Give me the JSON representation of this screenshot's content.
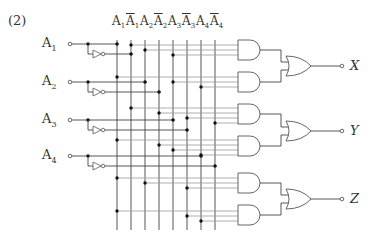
{
  "problem_number": "(2)",
  "inputs": [
    {
      "label": "A",
      "sub": "1",
      "y": 44,
      "inv_y": 54,
      "col": 117,
      "inv_col": 131
    },
    {
      "label": "A",
      "sub": "2",
      "y": 82,
      "inv_y": 92,
      "col": 145,
      "inv_col": 159
    },
    {
      "label": "A",
      "sub": "3",
      "y": 120,
      "inv_y": 130,
      "col": 173,
      "inv_col": 187
    },
    {
      "label": "A",
      "sub": "4",
      "y": 156,
      "inv_y": 166,
      "col": 201,
      "inv_col": 215
    }
  ],
  "bus_columns": [
    {
      "label": "A",
      "sub": "1",
      "inverted": false,
      "x": 117
    },
    {
      "label": "A",
      "sub": "1",
      "inverted": true,
      "x": 131
    },
    {
      "label": "A",
      "sub": "2",
      "inverted": false,
      "x": 145
    },
    {
      "label": "A",
      "sub": "2",
      "inverted": true,
      "x": 159
    },
    {
      "label": "A",
      "sub": "3",
      "inverted": false,
      "x": 173
    },
    {
      "label": "A",
      "sub": "3",
      "inverted": true,
      "x": 187
    },
    {
      "label": "A",
      "sub": "4",
      "inverted": false,
      "x": 201
    },
    {
      "label": "A",
      "sub": "4",
      "inverted": true,
      "x": 215
    }
  ],
  "and_gates": [
    {
      "y": 50,
      "inputs": [
        {
          "y": 45,
          "col": 131
        },
        {
          "y": 50,
          "col": 145
        },
        {
          "y": 55,
          "col": 173
        }
      ]
    },
    {
      "y": 82,
      "inputs": [
        {
          "y": 77,
          "col": 117
        },
        {
          "y": 82,
          "col": 173
        },
        {
          "y": 87,
          "col": 201
        }
      ]
    },
    {
      "y": 114,
      "inputs": [
        {
          "y": 108,
          "col": 131
        },
        {
          "y": 113,
          "col": 159
        },
        {
          "y": 118,
          "col": 187
        },
        {
          "y": 123,
          "col": 215
        }
      ]
    },
    {
      "y": 146,
      "inputs": [
        {
          "y": 140,
          "col": 117
        },
        {
          "y": 145,
          "col": 159
        },
        {
          "y": 150,
          "col": 173
        },
        {
          "y": 155,
          "col": 201
        }
      ]
    },
    {
      "y": 183,
      "inputs": [
        {
          "y": 178,
          "col": 117
        },
        {
          "y": 183,
          "col": 145
        },
        {
          "y": 188,
          "col": 187
        }
      ]
    },
    {
      "y": 215,
      "inputs": [
        {
          "y": 211,
          "col": 117
        },
        {
          "y": 216,
          "col": 187
        },
        {
          "y": 221,
          "col": 201
        }
      ]
    }
  ],
  "or_gates": [
    {
      "y": 66,
      "output": "X"
    },
    {
      "y": 131,
      "output": "Y"
    },
    {
      "y": 199,
      "output": "Z"
    }
  ],
  "colors": {
    "wire": "#444444",
    "gate": "#555555",
    "dot": "#111111",
    "gray_wire": "#9a9a9a"
  }
}
